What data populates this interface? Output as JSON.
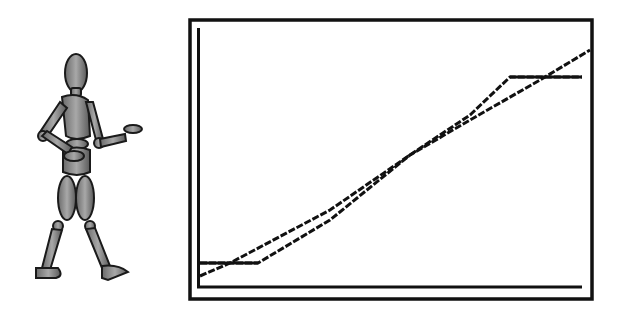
{
  "figure": {
    "icon": "walking-mannequin-icon"
  },
  "chart_data": {
    "type": "line",
    "title": "",
    "xlabel": "",
    "ylabel": "",
    "grid": false,
    "legend": null,
    "frame": {
      "outer": [
        189,
        19,
        593,
        300
      ],
      "axis_origin": [
        198,
        287
      ],
      "axis_x_end": 582,
      "axis_y_top": 28
    },
    "series": [
      {
        "name": "line-a",
        "points": [
          [
            200,
            276
          ],
          [
            230,
            263
          ],
          [
            330,
            210
          ],
          [
            410,
            155
          ],
          [
            470,
            115
          ],
          [
            510,
            77
          ],
          [
            582,
            77
          ]
        ]
      },
      {
        "name": "line-b",
        "points": [
          [
            200,
            263
          ],
          [
            258,
            263
          ],
          [
            330,
            220
          ],
          [
            410,
            155
          ],
          [
            470,
            120
          ],
          [
            540,
            80
          ],
          [
            590,
            50
          ]
        ]
      }
    ],
    "colors": {
      "line": "#111111",
      "frame": "#111111",
      "background": "#ffffff"
    }
  }
}
